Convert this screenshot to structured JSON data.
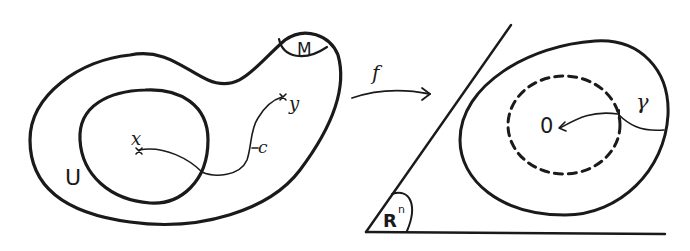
{
  "diagram": {
    "left_region": {
      "outer_set_label": "M",
      "neighborhood_label": "U",
      "point_x_label": "x",
      "point_y_label": "y",
      "curve_label": "c"
    },
    "map": {
      "label": "f"
    },
    "right_region": {
      "space_label": "R",
      "space_superscript": "n",
      "origin_label": "0",
      "curve_label": "γ"
    },
    "colors": {
      "ink": "#1a1a1a",
      "background": "#ffffff"
    }
  }
}
